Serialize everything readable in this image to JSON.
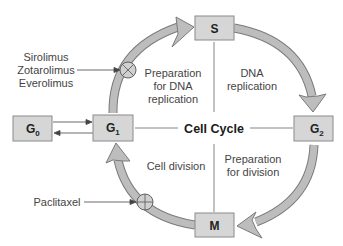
{
  "diagram": {
    "title": "Cell Cycle",
    "phases": {
      "S": {
        "label": "S",
        "sub": ""
      },
      "G2": {
        "label": "G",
        "sub": "2"
      },
      "M": {
        "label": "M",
        "sub": ""
      },
      "G1": {
        "label": "G",
        "sub": "1"
      },
      "G0": {
        "label": "G",
        "sub": "0"
      }
    },
    "quadrants": {
      "top_left": [
        "Preparation",
        "for DNA",
        "replication"
      ],
      "top_right": [
        "DNA",
        "replication"
      ],
      "bottom_left": [
        "Cell division"
      ],
      "bottom_right": [
        "Preparation",
        "for division"
      ]
    },
    "inhibitors": {
      "g1_s": [
        "Sirolimus",
        "Zotarolimus",
        "Everolimus"
      ],
      "m_g1": [
        "Paclitaxel"
      ]
    },
    "colors": {
      "arc_fill": "#b8b8b8",
      "arc_stroke": "#7a7a7a",
      "box_fill": "#d6d6d6",
      "box_stroke": "#8a8a8a",
      "line": "#666666"
    }
  }
}
